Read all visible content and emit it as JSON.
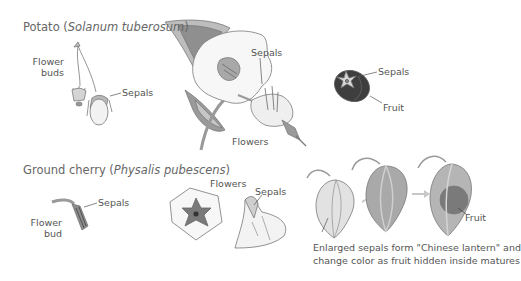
{
  "potato": {
    "title_common": "Potato (",
    "title_species": "Solanum tuberosum",
    "title_close": ")",
    "labels": {
      "flower_buds_1": "Flower",
      "flower_buds_2": "buds",
      "bud_sepals": "Sepals",
      "flower_sepals": "Sepals",
      "flowers": "Flowers",
      "fruit_sepals": "Sepals",
      "fruit": "Fruit"
    }
  },
  "ground_cherry": {
    "title_common": "Ground cherry (",
    "title_species": "Physalis pubescens",
    "title_close": ")",
    "labels": {
      "flower_bud_1": "Flower",
      "flower_bud_2": "bud",
      "bud_sepals": "Sepals",
      "flowers": "Flowers",
      "flower_sepals": "Sepals",
      "fruit": "Fruit"
    },
    "caption_line1": "Enlarged sepals form \"Chinese lantern\" and",
    "caption_line2": "change color as fruit hidden inside matures"
  },
  "colors": {
    "leaf_dark": "#8f8f8f",
    "leaf_light": "#c4c4c4",
    "petal": "#f7f7f7",
    "outline": "#7a7a7a",
    "fruit_dark": "#3e3e3e",
    "lantern_pale": "#e2e2e2",
    "lantern_mid": "#a9a9a9",
    "lantern_dark": "#8a8a8a",
    "arrow": "#c8c8c8"
  }
}
